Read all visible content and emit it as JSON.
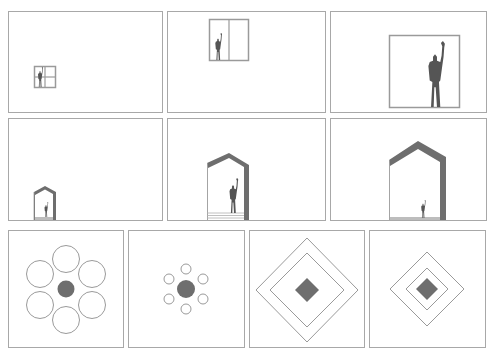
{
  "figure": {
    "colors": {
      "frame": "#a8a8a8",
      "fill": "#6e6e6e",
      "figure": "#555555",
      "line": "#9a9a9a"
    },
    "rows": [
      {
        "name": "window-scale-row",
        "panels": [
          {
            "name": "small-window",
            "window_size": "small"
          },
          {
            "name": "medium-window",
            "window_size": "medium"
          },
          {
            "name": "large-window",
            "window_size": "large"
          }
        ]
      },
      {
        "name": "house-scale-row",
        "panels": [
          {
            "name": "small-house",
            "house_size": "small"
          },
          {
            "name": "medium-house",
            "house_size": "medium"
          },
          {
            "name": "large-house",
            "house_size": "large"
          }
        ]
      },
      {
        "name": "geometry-row",
        "panels": [
          {
            "name": "large-circles",
            "shape": "circles",
            "count": 6
          },
          {
            "name": "small-circles",
            "shape": "circles",
            "count": 6
          },
          {
            "name": "wide-diamonds",
            "shape": "diamonds",
            "count": 3
          },
          {
            "name": "tight-diamonds",
            "shape": "diamonds",
            "count": 3
          }
        ]
      }
    ]
  }
}
